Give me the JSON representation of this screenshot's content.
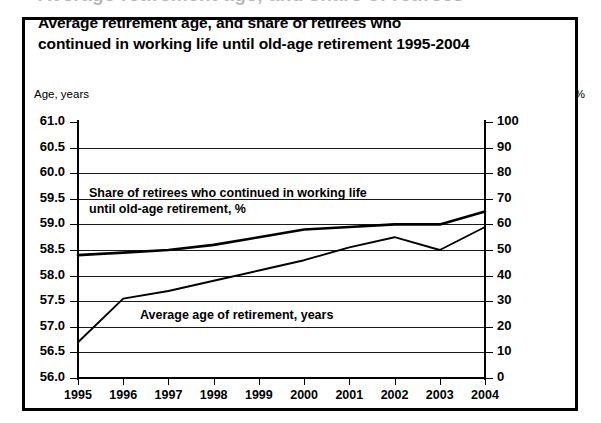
{
  "top_bleed_text": "Average retirement age, and share of retirees",
  "title": {
    "line1": "Average retirement age, and share of retirees who",
    "line2": "continued in working life until old-age retirement 1995-2004"
  },
  "axis_caption_left": "Age, years",
  "axis_caption_right": "%",
  "annotations": {
    "share_line1": "Share of retirees who continued in working life",
    "share_line2": "until old-age retirement, %",
    "average_line": "Average age of retirement, years"
  },
  "chart_data": {
    "type": "line",
    "title": "Average retirement age, and share of retirees who continued in working life until old-age retirement 1995-2004",
    "xlabel": "",
    "ylabel": "Age, years",
    "y2label": "%",
    "categories": [
      "1995",
      "1996",
      "1997",
      "1998",
      "1999",
      "2000",
      "2001",
      "2002",
      "2003",
      "2004"
    ],
    "ylim": [
      56.0,
      61.0
    ],
    "y2lim": [
      0,
      100
    ],
    "yticks": [
      "56.0",
      "56.5",
      "57.0",
      "57.5",
      "58.0",
      "58.5",
      "59.0",
      "59.5",
      "60.0",
      "60.5",
      "61.0"
    ],
    "y2ticks": [
      "0",
      "10",
      "20",
      "30",
      "40",
      "50",
      "60",
      "70",
      "80",
      "90",
      "100"
    ],
    "grid": true,
    "legend": "inline-annotations",
    "series": [
      {
        "name": "Share of retirees who continued in working life until old-age retirement, %",
        "axis": "right",
        "unit": "%",
        "values": [
          48,
          49,
          50,
          52,
          55,
          58,
          59,
          60,
          60,
          65
        ],
        "values_on_left_scale": [
          58.4,
          58.45,
          58.5,
          58.6,
          58.75,
          58.9,
          58.95,
          59.0,
          59.0,
          59.25
        ]
      },
      {
        "name": "Average age of retirement, years",
        "axis": "left",
        "unit": "years",
        "values": [
          56.7,
          57.55,
          57.7,
          57.9,
          58.1,
          58.3,
          58.55,
          58.75,
          58.5,
          58.95
        ],
        "values_on_right_scale": [
          14,
          31,
          34,
          38,
          42,
          46,
          51,
          55,
          50,
          59
        ]
      }
    ]
  }
}
